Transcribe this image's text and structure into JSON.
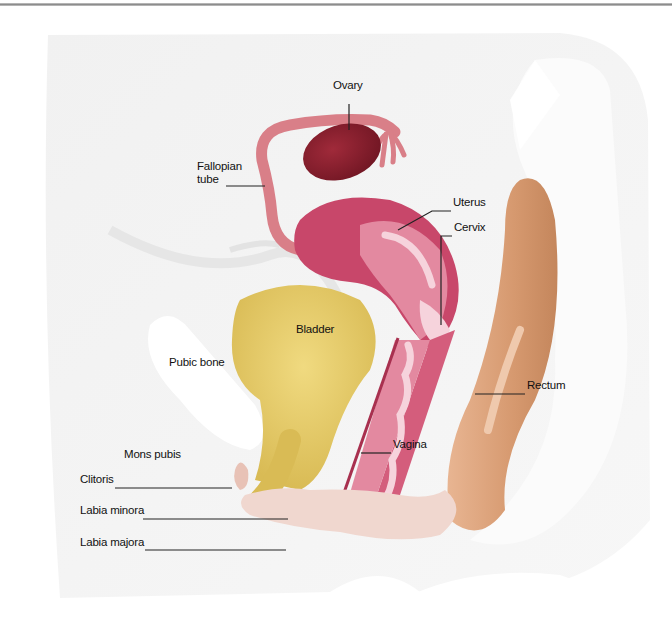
{
  "diagram": {
    "type": "anatomical-illustration",
    "colors": {
      "background_body": "#f3f3f3",
      "ovary": "#8a1f2d",
      "fallopian_tube": "#d97f88",
      "uterus_outer": "#c8476a",
      "uterus_inner": "#e389a0",
      "cervix_canal": "#f6d3dc",
      "bladder": "#e6cc6a",
      "rectum": "#d9a27c",
      "vagina_wall": "#d45d7c",
      "vulva": "#f0d7cf",
      "leader_line": "#222222"
    },
    "labels": [
      {
        "id": "ovary",
        "text": "Ovary",
        "x": 333,
        "y": 89
      },
      {
        "id": "fallopian-tube",
        "text": "Fallopian\ntube",
        "x": 197,
        "y": 170
      },
      {
        "id": "uterus",
        "text": "Uterus",
        "x": 453,
        "y": 206
      },
      {
        "id": "cervix",
        "text": "Cervix",
        "x": 454,
        "y": 231
      },
      {
        "id": "bladder",
        "text": "Bladder",
        "x": 296,
        "y": 333
      },
      {
        "id": "pubic-bone",
        "text": "Pubic bone",
        "x": 169,
        "y": 366
      },
      {
        "id": "rectum",
        "text": "Rectum",
        "x": 527,
        "y": 389
      },
      {
        "id": "vagina",
        "text": "Vagina",
        "x": 393,
        "y": 448
      },
      {
        "id": "mons-pubis",
        "text": "Mons pubis",
        "x": 124,
        "y": 458
      },
      {
        "id": "clitoris",
        "text": "Clitoris",
        "x": 80,
        "y": 483
      },
      {
        "id": "labia-minora",
        "text": "Labia minora",
        "x": 80,
        "y": 514
      },
      {
        "id": "labia-majora",
        "text": "Labia majora",
        "x": 80,
        "y": 546
      }
    ]
  }
}
